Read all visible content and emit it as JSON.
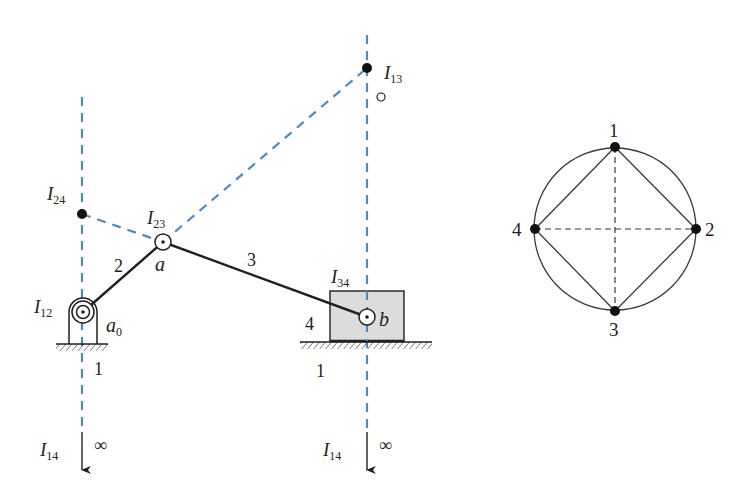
{
  "colors": {
    "ink": "#231f20",
    "dashed_blue": "#4a8ac9",
    "block_fill": "#dcdcdc",
    "graph_line": "#3a3a3a"
  },
  "mechanism": {
    "links": [
      {
        "id": "2",
        "label": "2"
      },
      {
        "id": "3",
        "label": "3"
      },
      {
        "id": "4",
        "label": "4"
      }
    ],
    "ground_labels": [
      "1",
      "1"
    ],
    "points": {
      "a0": {
        "main": "a",
        "sub": "0"
      },
      "a": {
        "main": "a"
      },
      "b": {
        "main": "b"
      }
    },
    "instant_centers": {
      "I12": {
        "main": "I",
        "sub": "12"
      },
      "I13": {
        "main": "I",
        "sub": "13"
      },
      "I14_left": {
        "main": "I",
        "sub": "14"
      },
      "I14_right": {
        "main": "I",
        "sub": "14"
      },
      "I23": {
        "main": "I",
        "sub": "23"
      },
      "I24": {
        "main": "I",
        "sub": "24"
      },
      "I34": {
        "main": "I",
        "sub": "34"
      }
    },
    "infinity_symbol": "∞"
  },
  "linear_graph": {
    "nodes": [
      "1",
      "2",
      "3",
      "4"
    ],
    "solid_edges": [
      [
        "1",
        "2"
      ],
      [
        "2",
        "3"
      ],
      [
        "3",
        "4"
      ],
      [
        "4",
        "1"
      ]
    ],
    "dashed_edges": [
      [
        "1",
        "3"
      ],
      [
        "2",
        "4"
      ]
    ]
  }
}
